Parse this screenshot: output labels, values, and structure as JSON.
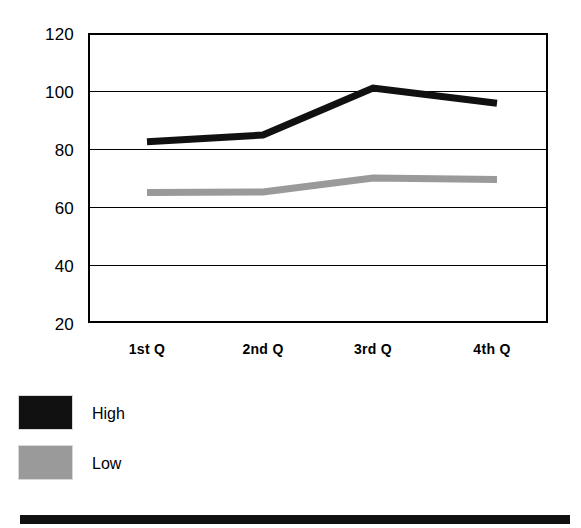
{
  "chart_data": {
    "type": "line",
    "title": "",
    "xlabel": "",
    "ylabel": "",
    "categories": [
      "1st Q",
      "2nd Q",
      "3rd Q",
      "4th Q"
    ],
    "series": [
      {
        "name": "High",
        "color": "#111111",
        "values": [
          82.5,
          84.8,
          101.0,
          95.8
        ]
      },
      {
        "name": "Low",
        "color": "#9a9a9a",
        "values": [
          65.0,
          65.2,
          70.0,
          69.5
        ]
      }
    ],
    "ylim": [
      20,
      120
    ],
    "yticks": [
      20,
      40,
      60,
      80,
      100,
      120
    ],
    "ytick_labels": [
      "20",
      "40",
      "60",
      "80",
      "100",
      "120"
    ],
    "grid": true,
    "legend_position": "below-left",
    "legend_entries": [
      {
        "label": "High",
        "swatch_color": "#111111"
      },
      {
        "label": "Low",
        "swatch_color": "#9a9a9a"
      }
    ]
  },
  "axes": {
    "y": {
      "ticks": [
        {
          "value": 120,
          "label": "120"
        },
        {
          "value": 100,
          "label": "100"
        },
        {
          "value": 80,
          "label": "80"
        },
        {
          "value": 60,
          "label": "60"
        },
        {
          "value": 40,
          "label": "40"
        },
        {
          "value": 20,
          "label": "20"
        }
      ]
    },
    "x": {
      "ticks": [
        {
          "label": "1st Q"
        },
        {
          "label": "2nd Q"
        },
        {
          "label": "3rd Q"
        },
        {
          "label": "4th Q"
        }
      ]
    }
  },
  "legend": {
    "high_label": "High",
    "low_label": "Low"
  },
  "colors": {
    "high": "#111111",
    "low": "#9a9a9a",
    "axis": "#000000",
    "background": "#ffffff",
    "bottom_bar": "#111111"
  }
}
